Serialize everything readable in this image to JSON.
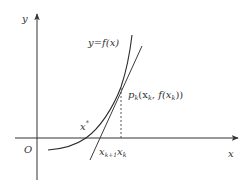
{
  "diagram": {
    "colors": {
      "axis": "#333333",
      "curve": "#2a2a2a",
      "tangent": "#3a3a3a",
      "dashed": "#444444",
      "text": "#333333"
    },
    "labels": {
      "y_axis": "y",
      "x_axis": "x",
      "origin": "O",
      "curve": "y=f(x)",
      "point_p": "p",
      "point_p_sub": "k",
      "point_coords_open": "(x",
      "point_coords_sub1": "k",
      "point_coords_mid": ", f(x",
      "point_coords_sub2": "k",
      "point_coords_close": "))",
      "root": "x",
      "root_sup": "*",
      "x_k1": "x",
      "x_k1_sub": "k+1",
      "x_k": "x",
      "x_k_sub": "k"
    }
  }
}
